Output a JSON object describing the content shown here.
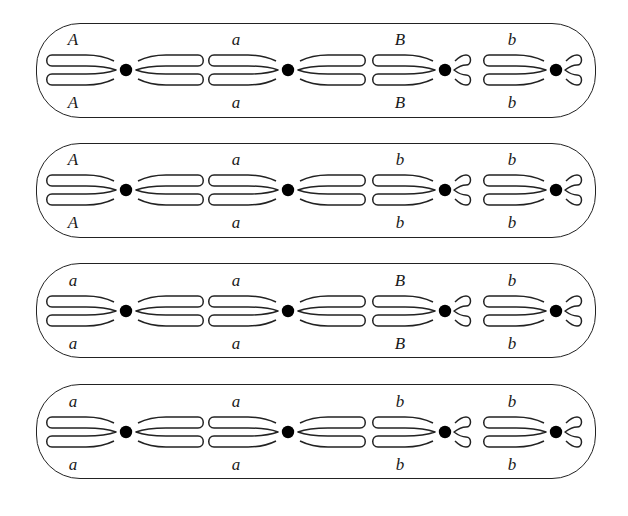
{
  "diagram": {
    "colors": {
      "outline": "#222222",
      "centromere": "#000000",
      "label": "#1a1a1a",
      "background": "#ffffff"
    },
    "panels": [
      {
        "id": "panel-1",
        "genotype": "AaBb",
        "chromosomes": [
          {
            "size": "long",
            "label_top": "A",
            "label_bottom": "A"
          },
          {
            "size": "long",
            "label_top": "a",
            "label_bottom": "a"
          },
          {
            "size": "short",
            "label_top": "B",
            "label_bottom": "B"
          },
          {
            "size": "short",
            "label_top": "b",
            "label_bottom": "b"
          }
        ]
      },
      {
        "id": "panel-2",
        "genotype": "Aabb",
        "chromosomes": [
          {
            "size": "long",
            "label_top": "A",
            "label_bottom": "A"
          },
          {
            "size": "long",
            "label_top": "a",
            "label_bottom": "a"
          },
          {
            "size": "short",
            "label_top": "b",
            "label_bottom": "b"
          },
          {
            "size": "short",
            "label_top": "b",
            "label_bottom": "b"
          }
        ]
      },
      {
        "id": "panel-3",
        "genotype": "aaBb",
        "chromosomes": [
          {
            "size": "long",
            "label_top": "a",
            "label_bottom": "a"
          },
          {
            "size": "long",
            "label_top": "a",
            "label_bottom": "a"
          },
          {
            "size": "short",
            "label_top": "B",
            "label_bottom": "B"
          },
          {
            "size": "short",
            "label_top": "b",
            "label_bottom": "b"
          }
        ]
      },
      {
        "id": "panel-4",
        "genotype": "aabb",
        "chromosomes": [
          {
            "size": "long",
            "label_top": "a",
            "label_bottom": "a"
          },
          {
            "size": "long",
            "label_top": "a",
            "label_bottom": "a"
          },
          {
            "size": "short",
            "label_top": "b",
            "label_bottom": "b"
          },
          {
            "size": "short",
            "label_top": "b",
            "label_bottom": "b"
          }
        ]
      }
    ]
  }
}
